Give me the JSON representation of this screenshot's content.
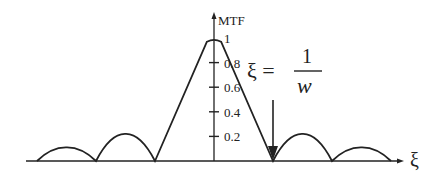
{
  "chart_data": {
    "type": "line",
    "title": "",
    "xlabel": "ξ",
    "ylabel": "MTF",
    "ylim": [
      0,
      1
    ],
    "yticks": [
      "0.2",
      "0.4",
      "0.6",
      "0.8",
      "1"
    ],
    "ytick_values": [
      0.2,
      0.4,
      0.6,
      0.8,
      1.0
    ],
    "series": [
      {
        "name": "MTF",
        "description": "central triangular lobe peaking at 1 with side lobes",
        "points": [
          {
            "x": -3.0,
            "y": 0.0
          },
          {
            "x": -2.5,
            "y": 0.11
          },
          {
            "x": -2.0,
            "y": 0.0
          },
          {
            "x": -1.5,
            "y": 0.22
          },
          {
            "x": -1.0,
            "y": 0.0
          },
          {
            "x": 0.0,
            "y": 1.0
          },
          {
            "x": 1.0,
            "y": 0.0
          },
          {
            "x": 1.5,
            "y": 0.22
          },
          {
            "x": 2.0,
            "y": 0.0
          },
          {
            "x": 2.5,
            "y": 0.11
          },
          {
            "x": 3.0,
            "y": 0.0
          }
        ]
      }
    ],
    "annotations": [
      {
        "text_lhs": "ξ =",
        "numerator": "1",
        "denominator": "w",
        "points_to_x": 1.0,
        "kind": "arrow"
      }
    ],
    "grid": false,
    "legend": "none"
  }
}
